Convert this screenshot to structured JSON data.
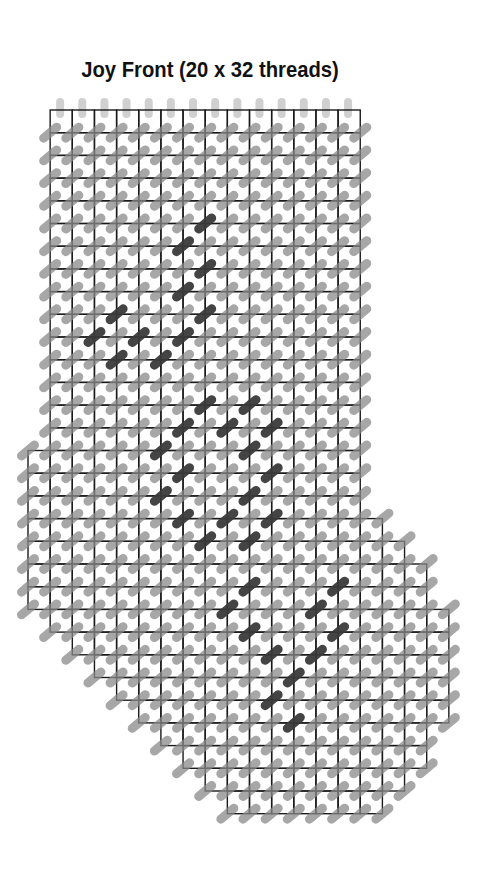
{
  "title": "Joy Front (20 x 32 threads)",
  "colors": {
    "grid_line": "#1a1a1a",
    "stitch_normal": "#8a8a8a",
    "stitch_dark": "#3a3a3a",
    "top_oval": "#c8c8c8",
    "background": "#ffffff"
  },
  "grid": {
    "origin_x": 28,
    "origin_y": 110,
    "cell_w": 22.15,
    "cell_h": 22.7,
    "columns": 19,
    "rows": 31,
    "row_spans": [
      [
        1,
        15
      ],
      [
        1,
        15
      ],
      [
        1,
        15
      ],
      [
        1,
        15
      ],
      [
        1,
        15
      ],
      [
        1,
        15
      ],
      [
        1,
        15
      ],
      [
        1,
        15
      ],
      [
        1,
        15
      ],
      [
        1,
        15
      ],
      [
        1,
        15
      ],
      [
        1,
        15
      ],
      [
        1,
        15
      ],
      [
        1,
        15
      ],
      [
        1,
        15
      ],
      [
        0,
        15
      ],
      [
        0,
        15
      ],
      [
        0,
        15
      ],
      [
        0,
        16
      ],
      [
        0,
        17
      ],
      [
        0,
        18
      ],
      [
        0,
        18
      ],
      [
        1,
        19
      ],
      [
        2,
        19
      ],
      [
        3,
        19
      ],
      [
        4,
        19
      ],
      [
        5,
        19
      ],
      [
        6,
        18
      ],
      [
        7,
        18
      ],
      [
        8,
        17
      ],
      [
        9,
        16
      ]
    ]
  },
  "dark_stitches": [
    [
      8,
      5
    ],
    [
      7,
      6
    ],
    [
      8,
      7
    ],
    [
      7,
      8
    ],
    [
      8,
      9
    ],
    [
      4,
      9
    ],
    [
      7,
      10
    ],
    [
      5,
      10
    ],
    [
      3,
      10
    ],
    [
      4,
      11
    ],
    [
      6,
      11
    ],
    [
      8,
      13
    ],
    [
      10,
      13
    ],
    [
      7,
      14
    ],
    [
      9,
      14
    ],
    [
      11,
      14
    ],
    [
      6,
      15
    ],
    [
      10,
      15
    ],
    [
      7,
      16
    ],
    [
      11,
      16
    ],
    [
      6,
      17
    ],
    [
      10,
      17
    ],
    [
      7,
      18
    ],
    [
      9,
      18
    ],
    [
      11,
      18
    ],
    [
      8,
      19
    ],
    [
      10,
      19
    ],
    [
      10,
      21
    ],
    [
      14,
      21
    ],
    [
      9,
      22
    ],
    [
      13,
      22
    ],
    [
      10,
      23
    ],
    [
      14,
      23
    ],
    [
      11,
      24
    ],
    [
      13,
      24
    ],
    [
      12,
      25
    ],
    [
      11,
      26
    ],
    [
      12,
      27
    ]
  ],
  "legend": {
    "stitch_type": "diagonal-half-cross",
    "motif": "JOY"
  }
}
